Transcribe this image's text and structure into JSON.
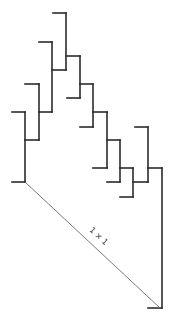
{
  "diagram": {
    "type": "dendrogram",
    "stroke_color": "#2b2b2b",
    "diagonal_color": "#6a6a6a",
    "diagonal_label": "1 × 1",
    "segments": [
      [
        53,
        13,
        66,
        13
      ],
      [
        66,
        13,
        66,
        70
      ],
      [
        39,
        42,
        52,
        42
      ],
      [
        52,
        42,
        52,
        112
      ],
      [
        52,
        70,
        66,
        70
      ],
      [
        25,
        84,
        39,
        84
      ],
      [
        39,
        84,
        39,
        140
      ],
      [
        25,
        140,
        39,
        140
      ],
      [
        39,
        112,
        52,
        112
      ],
      [
        12,
        112,
        25,
        112
      ],
      [
        25,
        112,
        25,
        182
      ],
      [
        12,
        182,
        25,
        182
      ],
      [
        66,
        56,
        80,
        56
      ],
      [
        80,
        56,
        80,
        98
      ],
      [
        67,
        98,
        80,
        98
      ],
      [
        80,
        84,
        93,
        84
      ],
      [
        93,
        84,
        93,
        127
      ],
      [
        80,
        127,
        93,
        127
      ],
      [
        93,
        112,
        107,
        112
      ],
      [
        107,
        112,
        107,
        168
      ],
      [
        93,
        168,
        107,
        168
      ],
      [
        107,
        140,
        120,
        140
      ],
      [
        120,
        140,
        120,
        182
      ],
      [
        107,
        182,
        120,
        182
      ],
      [
        120,
        168,
        133,
        168
      ],
      [
        133,
        168,
        133,
        197
      ],
      [
        120,
        197,
        133,
        197
      ],
      [
        133,
        182,
        148,
        182
      ],
      [
        135,
        127,
        148,
        127
      ],
      [
        148,
        127,
        148,
        182
      ],
      [
        148,
        168,
        162,
        168
      ],
      [
        162,
        168,
        162,
        308
      ],
      [
        148,
        308,
        162,
        308
      ]
    ],
    "diagonal": [
      25,
      182,
      160,
      308
    ],
    "label_pos": [
      97,
      238
    ],
    "label_rotation": 43
  }
}
